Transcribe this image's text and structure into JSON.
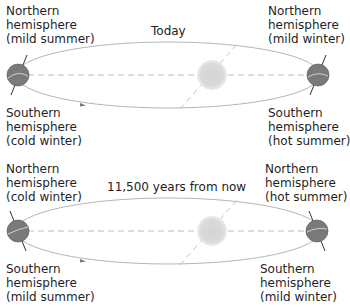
{
  "panels": [
    {
      "title": "Today",
      "left_earth": {
        "north_label": [
          "Northern",
          "hemisphere",
          "(mild summer)"
        ],
        "south_label": [
          "Southern",
          "hemisphere",
          "(cold winter)"
        ]
      },
      "right_earth": {
        "north_label": [
          "Northern",
          "hemisphere",
          "(mild winter)"
        ],
        "south_label": [
          "Southern",
          "hemisphere",
          "(hot summer)"
        ]
      }
    },
    {
      "title": "11,500 years from now",
      "left_earth": {
        "north_label": [
          "Northern",
          "hemisphere",
          "(cold winter)"
        ],
        "south_label": [
          "Southern",
          "hemisphere",
          "(mild summer)"
        ]
      },
      "right_earth": {
        "north_label": [
          "Northern",
          "hemisphere",
          "(hot summer)"
        ],
        "south_label": [
          "Southern",
          "hemisphere",
          "(mild winter)"
        ]
      }
    }
  ],
  "colors": {
    "earth": "#7a7a7a",
    "earth_band": "#c8c8c8",
    "sun": "#d9d9d9",
    "orbit": "#b5b5b5",
    "dashed": "#bdbdbd",
    "axis": "#333333",
    "text": "#1f1f1f"
  }
}
